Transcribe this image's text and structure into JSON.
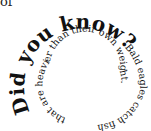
{
  "fragment": "of",
  "spiral": {
    "heading": "Did you know?",
    "fact": "Bald eagles catch fish that are heavier than their own weight."
  }
}
